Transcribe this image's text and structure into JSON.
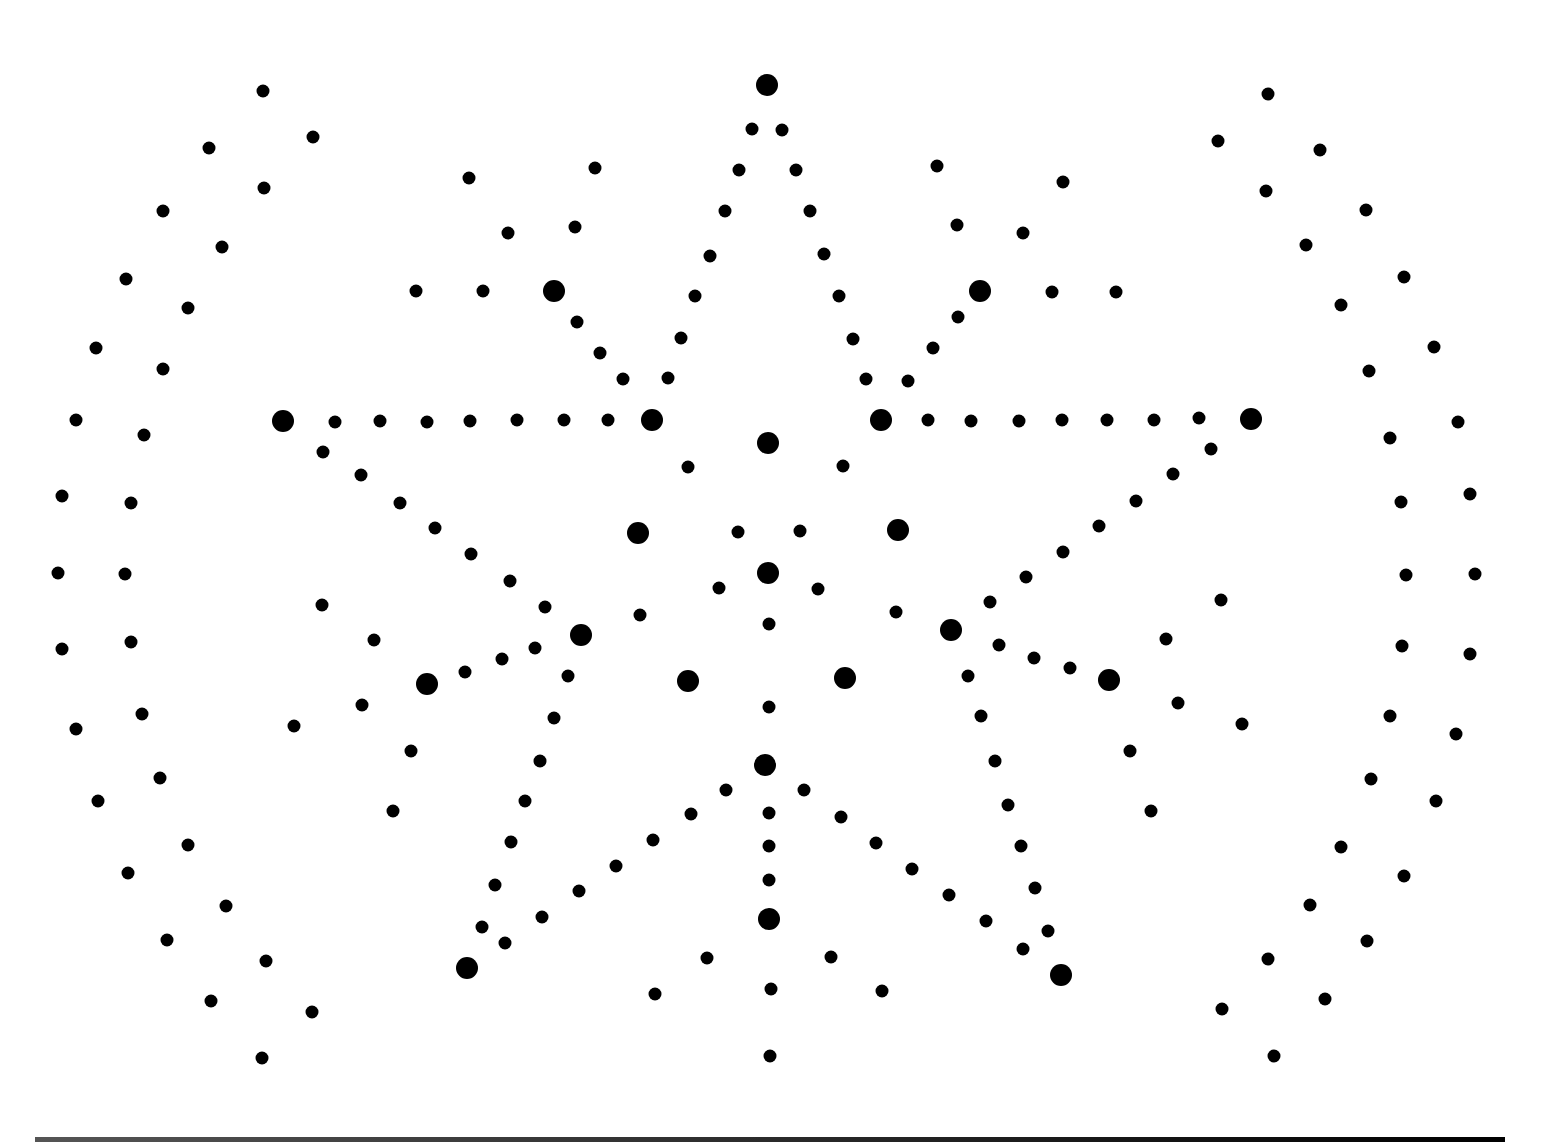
{
  "pattern": {
    "color": "#000000",
    "background": "#ffffff",
    "large_dots": [
      [
        767,
        85
      ],
      [
        554,
        291
      ],
      [
        980,
        291
      ],
      [
        283,
        421
      ],
      [
        652,
        420
      ],
      [
        881,
        420
      ],
      [
        1251,
        419
      ],
      [
        768,
        443
      ],
      [
        638,
        533
      ],
      [
        898,
        530
      ],
      [
        768,
        573
      ],
      [
        581,
        635
      ],
      [
        951,
        630
      ],
      [
        427,
        684
      ],
      [
        688,
        681
      ],
      [
        845,
        678
      ],
      [
        1109,
        680
      ],
      [
        765,
        765
      ],
      [
        769,
        919
      ],
      [
        467,
        968
      ],
      [
        1061,
        975
      ]
    ],
    "small_dots": [
      [
        263,
        91
      ],
      [
        313,
        137
      ],
      [
        209,
        148
      ],
      [
        264,
        188
      ],
      [
        163,
        211
      ],
      [
        222,
        247
      ],
      [
        126,
        279
      ],
      [
        188,
        308
      ],
      [
        96,
        348
      ],
      [
        163,
        369
      ],
      [
        76,
        420
      ],
      [
        144,
        435
      ],
      [
        62,
        496
      ],
      [
        131,
        503
      ],
      [
        58,
        573
      ],
      [
        125,
        574
      ],
      [
        62,
        649
      ],
      [
        131,
        642
      ],
      [
        76,
        729
      ],
      [
        142,
        714
      ],
      [
        98,
        801
      ],
      [
        160,
        778
      ],
      [
        128,
        873
      ],
      [
        188,
        845
      ],
      [
        167,
        940
      ],
      [
        226,
        906
      ],
      [
        211,
        1001
      ],
      [
        266,
        961
      ],
      [
        262,
        1058
      ],
      [
        312,
        1012
      ],
      [
        1268,
        94
      ],
      [
        1218,
        141
      ],
      [
        1320,
        150
      ],
      [
        1266,
        191
      ],
      [
        1366,
        210
      ],
      [
        1306,
        245
      ],
      [
        1404,
        277
      ],
      [
        1341,
        305
      ],
      [
        1434,
        347
      ],
      [
        1369,
        371
      ],
      [
        1458,
        422
      ],
      [
        1390,
        438
      ],
      [
        1470,
        494
      ],
      [
        1401,
        502
      ],
      [
        1475,
        574
      ],
      [
        1406,
        575
      ],
      [
        1470,
        654
      ],
      [
        1402,
        646
      ],
      [
        1456,
        734
      ],
      [
        1390,
        716
      ],
      [
        1436,
        801
      ],
      [
        1371,
        779
      ],
      [
        1404,
        876
      ],
      [
        1341,
        847
      ],
      [
        1367,
        941
      ],
      [
        1310,
        905
      ],
      [
        1325,
        999
      ],
      [
        1268,
        959
      ],
      [
        1274,
        1056
      ],
      [
        1222,
        1009
      ],
      [
        752,
        129
      ],
      [
        782,
        130
      ],
      [
        739,
        170
      ],
      [
        796,
        170
      ],
      [
        725,
        211
      ],
      [
        810,
        211
      ],
      [
        710,
        256
      ],
      [
        824,
        254
      ],
      [
        695,
        296
      ],
      [
        839,
        296
      ],
      [
        681,
        338
      ],
      [
        853,
        339
      ],
      [
        668,
        378
      ],
      [
        866,
        379
      ],
      [
        908,
        381
      ],
      [
        623,
        379
      ],
      [
        469,
        178
      ],
      [
        595,
        168
      ],
      [
        508,
        233
      ],
      [
        575,
        227
      ],
      [
        416,
        291
      ],
      [
        483,
        291
      ],
      [
        577,
        322
      ],
      [
        600,
        353
      ],
      [
        937,
        166
      ],
      [
        1063,
        182
      ],
      [
        957,
        225
      ],
      [
        1023,
        233
      ],
      [
        1052,
        292
      ],
      [
        1116,
        292
      ],
      [
        958,
        317
      ],
      [
        933,
        348
      ],
      [
        335,
        422
      ],
      [
        380,
        421
      ],
      [
        427,
        422
      ],
      [
        470,
        421
      ],
      [
        517,
        420
      ],
      [
        564,
        420
      ],
      [
        608,
        420
      ],
      [
        928,
        420
      ],
      [
        971,
        421
      ],
      [
        1019,
        421
      ],
      [
        1062,
        420
      ],
      [
        1107,
        420
      ],
      [
        1154,
        420
      ],
      [
        1199,
        418
      ],
      [
        688,
        467
      ],
      [
        843,
        466
      ],
      [
        738,
        532
      ],
      [
        800,
        531
      ],
      [
        719,
        588
      ],
      [
        818,
        589
      ],
      [
        640,
        615
      ],
      [
        896,
        612
      ],
      [
        769,
        624
      ],
      [
        769,
        707
      ],
      [
        323,
        452
      ],
      [
        361,
        475
      ],
      [
        400,
        503
      ],
      [
        435,
        528
      ],
      [
        471,
        554
      ],
      [
        510,
        581
      ],
      [
        545,
        607
      ],
      [
        1211,
        449
      ],
      [
        1173,
        474
      ],
      [
        1136,
        501
      ],
      [
        1099,
        526
      ],
      [
        1063,
        552
      ],
      [
        1026,
        577
      ],
      [
        990,
        602
      ],
      [
        322,
        605
      ],
      [
        374,
        640
      ],
      [
        362,
        705
      ],
      [
        294,
        726
      ],
      [
        411,
        751
      ],
      [
        393,
        811
      ],
      [
        1221,
        600
      ],
      [
        1166,
        639
      ],
      [
        1178,
        703
      ],
      [
        1242,
        724
      ],
      [
        1130,
        751
      ],
      [
        1151,
        811
      ],
      [
        465,
        672
      ],
      [
        502,
        659
      ],
      [
        535,
        648
      ],
      [
        568,
        676
      ],
      [
        554,
        718
      ],
      [
        540,
        761
      ],
      [
        525,
        801
      ],
      [
        511,
        842
      ],
      [
        495,
        885
      ],
      [
        482,
        927
      ],
      [
        505,
        943
      ],
      [
        999,
        645
      ],
      [
        1034,
        658
      ],
      [
        1070,
        668
      ],
      [
        968,
        676
      ],
      [
        981,
        716
      ],
      [
        995,
        761
      ],
      [
        1008,
        805
      ],
      [
        1021,
        846
      ],
      [
        1035,
        888
      ],
      [
        1048,
        931
      ],
      [
        1023,
        949
      ],
      [
        726,
        790
      ],
      [
        804,
        790
      ],
      [
        691,
        814
      ],
      [
        841,
        817
      ],
      [
        653,
        840
      ],
      [
        876,
        843
      ],
      [
        616,
        866
      ],
      [
        912,
        869
      ],
      [
        579,
        891
      ],
      [
        949,
        895
      ],
      [
        542,
        917
      ],
      [
        986,
        921
      ],
      [
        769,
        813
      ],
      [
        769,
        846
      ],
      [
        769,
        880
      ],
      [
        707,
        958
      ],
      [
        831,
        957
      ],
      [
        655,
        994
      ],
      [
        882,
        991
      ],
      [
        771,
        989
      ],
      [
        770,
        1056
      ]
    ]
  },
  "footer_rule": {
    "color": "#000000"
  }
}
